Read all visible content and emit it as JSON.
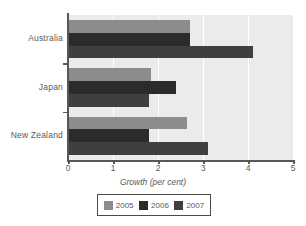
{
  "chart_data": {
    "type": "bar",
    "orientation": "horizontal",
    "title": "",
    "xlabel": "Growth (per cent)",
    "ylabel": "",
    "xlim": [
      0,
      5
    ],
    "xticks": [
      "0",
      "1",
      "2",
      "3",
      "4",
      "5"
    ],
    "grid": true,
    "legend_position": "bottom",
    "categories": [
      "Australia",
      "Japan",
      "New Zealand"
    ],
    "series": [
      {
        "name": "2005",
        "color": "#8c8c8c",
        "values": [
          2.7,
          1.85,
          2.65
        ]
      },
      {
        "name": "2006",
        "color": "#2b2b2b",
        "values": [
          2.7,
          2.4,
          1.8
        ]
      },
      {
        "name": "2007",
        "color": "#3f3f3f",
        "values": [
          4.1,
          1.8,
          3.1
        ]
      }
    ]
  },
  "axis": {
    "x_title": "Growth (per cent)"
  },
  "legend": {
    "entries": [
      {
        "label": "2005",
        "color": "#8c8c8c"
      },
      {
        "label": "2006",
        "color": "#2b2b2b"
      },
      {
        "label": "2007",
        "color": "#3f3f3f"
      }
    ]
  },
  "colors": {
    "plot_background": "#ebebeb",
    "gridline": "#ffffff",
    "axis": "#58585a",
    "text": "#5a5a5a"
  }
}
